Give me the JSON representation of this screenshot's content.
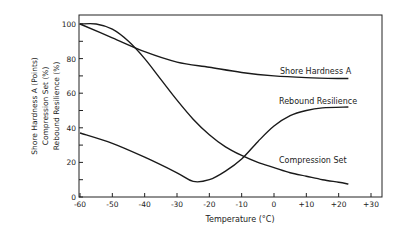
{
  "chart_data": {
    "type": "line",
    "title": "",
    "xlabel": "Temperature (°C)",
    "ylabel_lines": [
      "Shore Hardness A (Points)",
      "Compression Set (%)",
      "Rebound Resilience (%)"
    ],
    "xlim": [
      -60,
      30
    ],
    "ylim": [
      0,
      100
    ],
    "x_ticks": [
      -60,
      -50,
      -40,
      -30,
      -20,
      -10,
      0,
      10,
      20,
      30
    ],
    "x_tick_labels": [
      "-60",
      "-50",
      "-40",
      "-30",
      "-20",
      "-10",
      "0",
      "+10",
      "+20",
      "+30"
    ],
    "y_ticks": [
      0,
      20,
      40,
      60,
      80,
      100
    ],
    "y_tick_labels": [
      "0",
      "20",
      "40",
      "60",
      "80",
      "100"
    ],
    "grid": false,
    "legend": "inline labels",
    "series": [
      {
        "name": "Shore Hardness A",
        "x": [
          -60,
          -50,
          -40,
          -30,
          -20,
          -10,
          0,
          10,
          20,
          23
        ],
        "values": [
          100,
          92,
          84,
          78,
          75,
          72,
          70,
          69,
          68.5,
          68.5
        ]
      },
      {
        "name": "Rebound Resilience",
        "x": [
          -60,
          -50,
          -40,
          -30,
          -25,
          -20,
          -15,
          -10,
          -5,
          0,
          5,
          10,
          15,
          23
        ],
        "values": [
          37,
          31,
          23,
          14,
          9,
          10,
          15,
          22,
          32,
          41,
          47,
          50,
          51.5,
          52
        ]
      },
      {
        "name": "Compression Set",
        "x": [
          -60,
          -55,
          -50,
          -45,
          -40,
          -35,
          -30,
          -25,
          -20,
          -15,
          -10,
          -5,
          0,
          5,
          10,
          15,
          20,
          23
        ],
        "values": [
          100,
          100,
          97,
          90,
          80,
          68,
          56,
          45,
          36,
          29,
          24,
          20,
          17,
          14,
          12,
          10,
          8.5,
          7.5
        ]
      }
    ],
    "labels": {
      "shore": "Shore Hardness A",
      "rebound": "Rebound Resilience",
      "compression": "Compression Set"
    }
  }
}
